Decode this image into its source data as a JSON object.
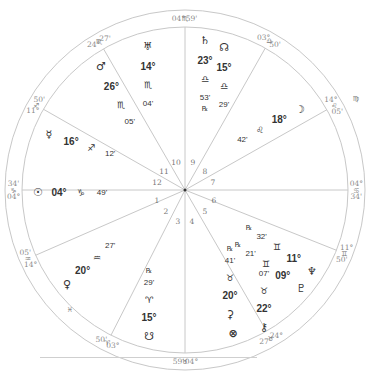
{
  "chart": {
    "type": "natal-wheel",
    "center": [
      185,
      190
    ],
    "outer_radius": 180,
    "inner_radius": 163,
    "line_color": "#c8c8c8",
    "text_color": "#333333",
    "cusp_text_color": "#8a8a8a"
  },
  "cusps": [
    {
      "house": 1,
      "angle": 180,
      "deg": "04°",
      "sign": "♑",
      "min": "34'"
    },
    {
      "house": 2,
      "angle": 203.6,
      "deg": "14°",
      "sign": "♒",
      "min": "05'"
    },
    {
      "house": 3,
      "angle": 243,
      "deg": "03°",
      "sign": "♈",
      "min": "50'"
    },
    {
      "house": 4,
      "angle": 270,
      "deg": "04°",
      "sign": "♉",
      "min": "59'"
    },
    {
      "house": 5,
      "angle": 300,
      "deg": "24°",
      "sign": "♉",
      "min": "27'"
    },
    {
      "house": 6,
      "angle": 338.3,
      "deg": "11°",
      "sign": "♊",
      "min": "50'"
    },
    {
      "house": 7,
      "angle": 0,
      "deg": "04°",
      "sign": "♋",
      "min": "34'"
    },
    {
      "house": 8,
      "angle": 29.5,
      "deg": "14°",
      "sign": "♌",
      "min": "05'"
    },
    {
      "house": 9,
      "angle": 60.5,
      "deg": "03°",
      "sign": "♎",
      "min": "50'"
    },
    {
      "house": 10,
      "angle": 90,
      "deg": "04°",
      "sign": "♏",
      "min": "59'"
    },
    {
      "house": 11,
      "angle": 120,
      "deg": "24°",
      "sign": "♏",
      "min": "27'"
    },
    {
      "house": 12,
      "angle": 150.3,
      "deg": "11°",
      "sign": "♐",
      "min": "50'"
    }
  ],
  "intercepted_signs": [
    {
      "sign": "♍",
      "position": [
        356,
        101
      ]
    },
    {
      "sign": "♓",
      "position": [
        70,
        312
      ]
    }
  ],
  "house_numbers": [
    {
      "n": "1",
      "x": 157,
      "y": 203
    },
    {
      "n": "2",
      "x": 166,
      "y": 214
    },
    {
      "n": "3",
      "x": 178,
      "y": 224
    },
    {
      "n": "4",
      "x": 192,
      "y": 224
    },
    {
      "n": "5",
      "x": 205,
      "y": 214
    },
    {
      "n": "6",
      "x": 214,
      "y": 203
    },
    {
      "n": "7",
      "x": 213,
      "y": 185
    },
    {
      "n": "8",
      "x": 205,
      "y": 174
    },
    {
      "n": "9",
      "x": 193,
      "y": 165
    },
    {
      "n": "10",
      "x": 176,
      "y": 165
    },
    {
      "n": "11",
      "x": 164,
      "y": 174
    },
    {
      "n": "12",
      "x": 157,
      "y": 185
    }
  ],
  "planets": [
    {
      "name": "Sun",
      "glyph": "☉",
      "deg": "04°",
      "sign": "♑",
      "min": "49'",
      "retro": "",
      "layout": "row",
      "x": 38,
      "y": 196
    },
    {
      "name": "Mercury",
      "glyph": "☿",
      "deg": "16°",
      "sign": "♐",
      "min": "12'",
      "retro": "",
      "layout": "diag",
      "x": 49,
      "y": 138,
      "dx": 17,
      "dy": 5
    },
    {
      "name": "Mars",
      "glyph": "♂",
      "deg": "26°",
      "sign": "♏",
      "min": "05'",
      "retro": "",
      "layout": "diag",
      "x": 101,
      "y": 70,
      "dx": 8,
      "dy": 15
    },
    {
      "name": "Uranus",
      "glyph": "♅",
      "deg": "14°",
      "sign": "♏",
      "min": "04'",
      "retro": "",
      "layout": "col",
      "x": 148,
      "y": 50
    },
    {
      "name": "Saturn",
      "glyph": "♄",
      "deg": "23°",
      "sign": "♎",
      "min": "53'",
      "retro": "℞",
      "layout": "col",
      "x": 205,
      "y": 44
    },
    {
      "name": "North Node",
      "glyph": "☊",
      "deg": "15°",
      "sign": "♎",
      "min": "29'",
      "retro": "",
      "layout": "col",
      "x": 224,
      "y": 51
    },
    {
      "name": "Moon",
      "glyph": "☽",
      "deg": "18°",
      "sign": "♌",
      "min": "42'",
      "retro": "",
      "layout": "diag",
      "x": 300,
      "y": 113,
      "dx": -16,
      "dy": 8
    },
    {
      "name": "Venus",
      "glyph": "♀",
      "deg": "20°",
      "sign": "♒",
      "min": "27'",
      "retro": "",
      "layout": "diag",
      "x": 67,
      "y": 288,
      "dx": 12,
      "dy": -11
    },
    {
      "name": "South Node",
      "glyph": "☋",
      "deg": "15°",
      "sign": "♈",
      "min": "29'",
      "retro": "℞",
      "layout": "colup",
      "x": 149,
      "y": 340
    },
    {
      "name": "Neptune",
      "glyph": "♆",
      "deg": "11°",
      "sign": "♊",
      "min": "32'",
      "retro": "℞",
      "layout": "diag",
      "x": 312,
      "y": 275,
      "dx": -14,
      "dy": -10
    },
    {
      "name": "Pluto",
      "glyph": "♇",
      "deg": "09°",
      "sign": "♊",
      "min": "21'",
      "retro": "℞",
      "layout": "diag",
      "x": 301,
      "y": 292,
      "dx": -14,
      "dy": -10
    },
    {
      "name": "Chiron",
      "glyph": "⚷",
      "deg": "22°",
      "sign": "♉",
      "min": "07'",
      "retro": "",
      "layout": "colup",
      "x": 264,
      "y": 331
    },
    {
      "name": "Ceres",
      "glyph": "⚳",
      "deg": "20°",
      "sign": "♉",
      "min": "41'",
      "retro": "℞",
      "layout": "colup",
      "x": 230,
      "y": 318
    },
    {
      "name": "Part of Fortune",
      "glyph": "⊗",
      "deg": "",
      "sign": "",
      "min": "",
      "retro": "",
      "layout": "single",
      "x": 233,
      "y": 337
    }
  ]
}
